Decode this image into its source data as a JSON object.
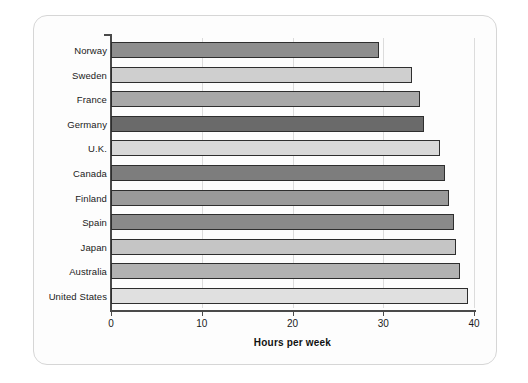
{
  "chart_data": {
    "type": "bar",
    "orientation": "horizontal",
    "title": "",
    "xlabel": "Hours per week",
    "ylabel": "",
    "xlim": [
      0,
      40
    ],
    "xticks": [
      0,
      10,
      20,
      30,
      40
    ],
    "xtick_labels": [
      "0",
      "10",
      "20",
      "30",
      "40"
    ],
    "grid": true,
    "grid_axis": "x",
    "legend": false,
    "categories": [
      "Norway",
      "Sweden",
      "France",
      "Germany",
      "U.K.",
      "Canada",
      "Finland",
      "Spain",
      "Japan",
      "Australia",
      "United States"
    ],
    "values": [
      29.5,
      33.2,
      34.1,
      34.5,
      36.2,
      36.8,
      37.2,
      37.8,
      38.0,
      38.5,
      39.3
    ],
    "bar_colors": [
      "#8e8e8e",
      "#cfcfcf",
      "#a8a8a8",
      "#6a6a6a",
      "#d8d8d8",
      "#7d7d7d",
      "#9a9a9a",
      "#8a8a8a",
      "#c5c5c5",
      "#b2b2b2",
      "#e0e0e0"
    ]
  },
  "axes": {
    "x_axis_title": "Hours per week"
  },
  "colors": {
    "card_background": "#fdfdfd",
    "card_border": "#d6d6d6",
    "axis": "#4a4a4a",
    "gridline": "#dcdcdc",
    "bar_outline": "#2e2e2e",
    "text": "#1a1a1a"
  }
}
